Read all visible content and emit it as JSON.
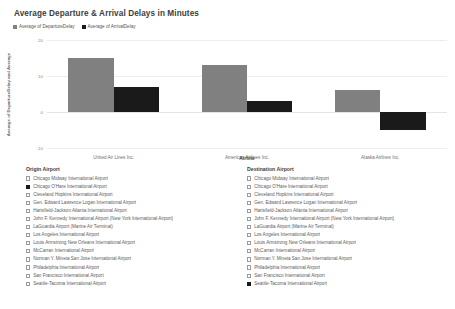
{
  "chart_data": {
    "type": "bar",
    "title": "Average Departure & Arrival Delays in Minutes",
    "xlabel": "Airline",
    "ylabel": "Average of DepartureDelay and Average",
    "categories": [
      "United Air Lines Inc.",
      "American Airlines Inc.",
      "Alaska Airlines Inc."
    ],
    "series": [
      {
        "name": "Average of DepartureDelay",
        "color": "#808080",
        "values": [
          15.0,
          13.0,
          6.0
        ]
      },
      {
        "name": "Average of ArrivalDelay",
        "color": "#1a1a1a",
        "values": [
          7.0,
          3.0,
          -5.0
        ]
      }
    ],
    "ylim": [
      -10,
      20
    ],
    "yticks": [
      "20",
      "10",
      "0",
      "-10"
    ],
    "ytick_values": [
      20,
      10,
      0,
      -10
    ],
    "grid": true,
    "legend_position": "top-left"
  },
  "legend": [
    {
      "label": "Average of DepartureDelay",
      "color": "#808080"
    },
    {
      "label": "Average of ArrivalDelay",
      "color": "#1a1a1a"
    }
  ],
  "filters": {
    "origin": {
      "title": "Origin Airport",
      "items": [
        {
          "label": "Chicago Midway International Airport",
          "checked": false
        },
        {
          "label": "Chicago O'Hare International Airport",
          "checked": true
        },
        {
          "label": "Cleveland Hopkins International Airport",
          "checked": false
        },
        {
          "label": "Gen. Edward Lawrence Logan International Airport",
          "checked": false
        },
        {
          "label": "Hartsfield-Jackson Atlanta International Airport",
          "checked": false
        },
        {
          "label": "John F. Kennedy International Airport (New York International Airport)",
          "checked": false
        },
        {
          "label": "LaGuardia Airport (Marine Air Terminal)",
          "checked": false
        },
        {
          "label": "Los Angeles International Airport",
          "checked": false
        },
        {
          "label": "Louis Armstrong New Orleans International Airport",
          "checked": false
        },
        {
          "label": "McCarran International Airport",
          "checked": false
        },
        {
          "label": "Norman Y. Mineta San Jose International Airport",
          "checked": false
        },
        {
          "label": "Philadelphia International Airport",
          "checked": false
        },
        {
          "label": "San Francisco International Airport",
          "checked": false
        },
        {
          "label": "Seattle-Tacoma International Airport",
          "checked": false
        }
      ]
    },
    "destination": {
      "title": "Destination Airport",
      "items": [
        {
          "label": "Chicago Midway International Airport",
          "checked": false
        },
        {
          "label": "Chicago O'Hare International Airport",
          "checked": false
        },
        {
          "label": "Cleveland Hopkins International Airport",
          "checked": false
        },
        {
          "label": "Gen. Edward Lawrence Logan International Airport",
          "checked": false
        },
        {
          "label": "Hartsfield-Jackson Atlanta International Airport",
          "checked": false
        },
        {
          "label": "John F. Kennedy International Airport (New York International Airport)",
          "checked": false
        },
        {
          "label": "LaGuardia Airport (Marine Air Terminal)",
          "checked": false
        },
        {
          "label": "Los Angeles International Airport",
          "checked": false
        },
        {
          "label": "Louis Armstrong New Orleans International Airport",
          "checked": false
        },
        {
          "label": "McCarran International Airport",
          "checked": false
        },
        {
          "label": "Norman Y. Mineta San Jose International Airport",
          "checked": false
        },
        {
          "label": "Philadelphia International Airport",
          "checked": false
        },
        {
          "label": "San Francisco International Airport",
          "checked": false
        },
        {
          "label": "Seattle-Tacoma International Airport",
          "checked": true
        }
      ]
    }
  }
}
